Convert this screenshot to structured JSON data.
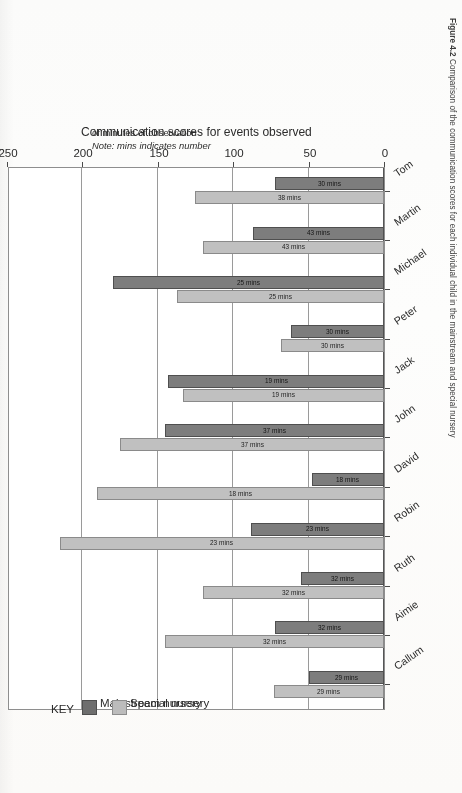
{
  "figure": {
    "caption_number": "Figure 4.2",
    "caption_text": "Comparison of the communication scores for each individual child in the mainstream and special nursery",
    "note_line1": "Note: mins indicates number",
    "note_line2": "of minutes of observation"
  },
  "legend": {
    "title": "KEY",
    "items": [
      {
        "label": "Mainstream nursery",
        "color": "#6e6e6e"
      },
      {
        "label": "Special nursery",
        "color": "#bcbcbc"
      }
    ]
  },
  "chart_data": {
    "type": "bar",
    "orientation": "vertical",
    "title": "",
    "xlabel": "",
    "ylabel": "Communication scores for events observed",
    "ylim": [
      0,
      250
    ],
    "yticks": [
      0,
      50,
      100,
      150,
      200,
      250
    ],
    "ytick_labels": [
      "0",
      "50",
      "100",
      "150",
      "200",
      "250"
    ],
    "grid": true,
    "legend_position": "right",
    "categories": [
      "Callum",
      "Aimie",
      "Ruth",
      "Robin",
      "David",
      "John",
      "Jack",
      "Peter",
      "Michael",
      "Martin",
      "Tom"
    ],
    "series": [
      {
        "name": "Mainstream nursery",
        "color": "#7d7d7d",
        "values": [
          50,
          72,
          55,
          88,
          48,
          145,
          143,
          62,
          180,
          87,
          72
        ],
        "point_labels": [
          "29 mins",
          "32 mins",
          "32 mins",
          "23 mins",
          "18 mins",
          "37 mins",
          "19 mins",
          "30 mins",
          "25 mins",
          "43 mins",
          "30 mins"
        ]
      },
      {
        "name": "Special nursery",
        "color": "#c0c0c0",
        "values": [
          73,
          145,
          120,
          215,
          190,
          175,
          133,
          68,
          137,
          120,
          125
        ],
        "point_labels": [
          "29 mins",
          "32 mins",
          "32 mins",
          "23 mins",
          "18 mins",
          "37 mins",
          "19 mins",
          "30 mins",
          "25 mins",
          "43 mins",
          "38 mins"
        ]
      }
    ]
  }
}
